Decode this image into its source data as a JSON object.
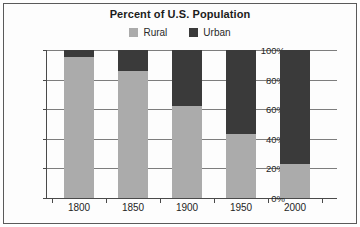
{
  "chart_data": {
    "type": "bar",
    "stacked": true,
    "title": "Percent of U.S. Population",
    "xlabel": "",
    "ylabel": "",
    "categories": [
      "1800",
      "1850",
      "1900",
      "1950",
      "2000"
    ],
    "series": [
      {
        "name": "Rural",
        "color": "#ababab",
        "values": [
          95,
          86,
          62,
          43,
          23
        ]
      },
      {
        "name": "Urban",
        "color": "#3a3a3a",
        "values": [
          5,
          14,
          38,
          57,
          77
        ]
      }
    ],
    "ylim": [
      0,
      100
    ],
    "yticks": [
      0,
      20,
      40,
      60,
      80,
      100
    ],
    "ytick_labels": [
      "0%",
      "20%",
      "40%",
      "60%",
      "80%",
      "100%"
    ],
    "grid": true,
    "grid_axis": "y",
    "legend_position": "top-center",
    "legend_entries": [
      "Rural",
      "Urban"
    ]
  },
  "colors": {
    "rural": "#ababab",
    "urban": "#3a3a3a",
    "axis": "#4a4a4a",
    "grid": "#7d7d7d",
    "text": "#1f1f1f",
    "border": "#5a5a5a",
    "background": "#fdfdfd"
  }
}
